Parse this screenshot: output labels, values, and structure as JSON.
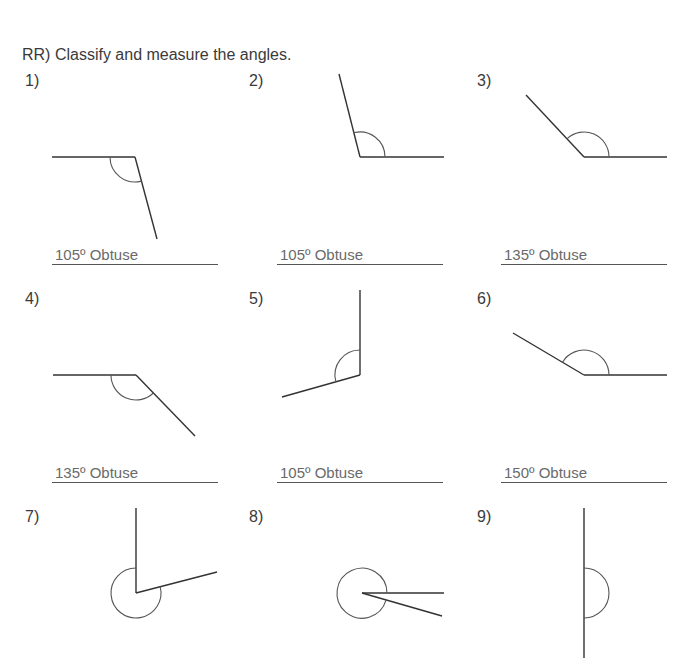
{
  "worksheet": {
    "title": "RR)  Classify and measure the angles.",
    "problems": [
      {
        "label": "1)",
        "answer": "105º Obtuse",
        "measure_deg": 105,
        "type": "Obtuse"
      },
      {
        "label": "2)",
        "answer": "105º Obtuse",
        "measure_deg": 105,
        "type": "Obtuse"
      },
      {
        "label": "3)",
        "answer": "135º Obtuse",
        "measure_deg": 135,
        "type": "Obtuse"
      },
      {
        "label": "4)",
        "answer": "135º Obtuse",
        "measure_deg": 135,
        "type": "Obtuse"
      },
      {
        "label": "5)",
        "answer": "105º Obtuse",
        "measure_deg": 105,
        "type": "Obtuse"
      },
      {
        "label": "6)",
        "answer": "150º Obtuse",
        "measure_deg": 150,
        "type": "Obtuse"
      },
      {
        "label": "7)",
        "answer": "",
        "measure_deg": null,
        "type": "Reflex"
      },
      {
        "label": "8)",
        "answer": "",
        "measure_deg": null,
        "type": "Reflex"
      },
      {
        "label": "9)",
        "answer": "",
        "measure_deg": 180,
        "type": "Straight"
      }
    ]
  },
  "colors": {
    "stroke": "#333333",
    "answer_text": "#6a6a6a",
    "background": "#ffffff"
  }
}
